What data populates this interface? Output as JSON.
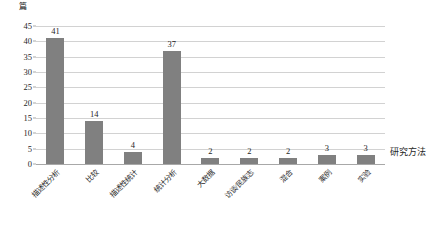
{
  "chart_data": {
    "type": "bar",
    "title": "",
    "subtitle": "",
    "xlabel": "研究方法",
    "ylabel": "篇",
    "categories": [
      "描述性分析",
      "比较",
      "描述性统计",
      "统计分析",
      "大数据",
      "访谈/民族志",
      "混合",
      "案例",
      "实验"
    ],
    "values": [
      41,
      14,
      4,
      37,
      2,
      2,
      2,
      3,
      3
    ],
    "value_labels": [
      "41",
      "14",
      "4",
      "37",
      "2",
      "2",
      "2",
      "3",
      "3"
    ],
    "ylim": [
      0,
      45
    ],
    "ytick_labels": [
      "0",
      "5",
      "10",
      "15",
      "20",
      "25",
      "30",
      "35",
      "40",
      "45"
    ],
    "ytick_values": [
      0,
      5,
      10,
      15,
      20,
      25,
      30,
      35,
      40,
      45
    ],
    "grid": true,
    "legend": "none",
    "bar_color": "#808080",
    "gridline_color": "#d2d2d2",
    "axis_color": "#a8a8a8"
  }
}
